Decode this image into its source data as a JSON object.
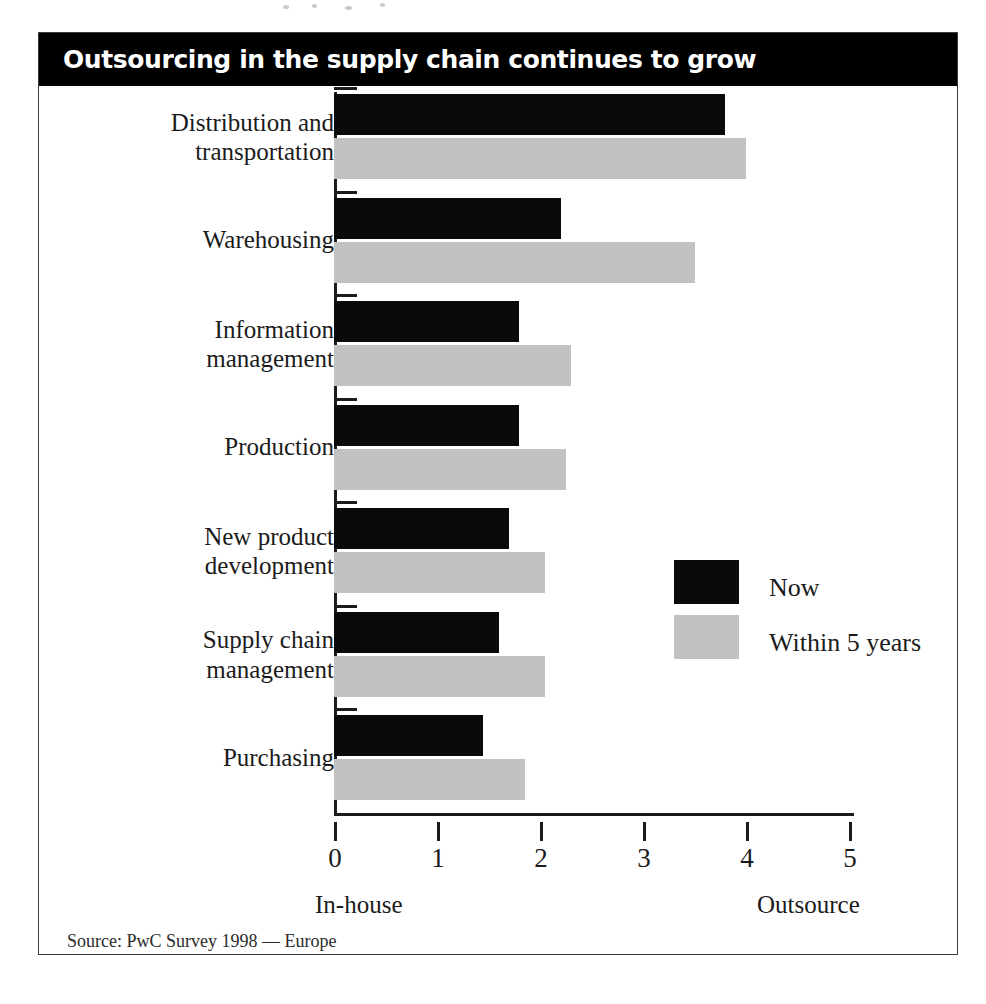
{
  "figure": {
    "title": "Outsourcing in the supply chain continues to grow",
    "source_note": "Source: PwC Survey 1998 — Europe"
  },
  "colors": {
    "title_bar_background": "#000000",
    "title_text": "#ffffff",
    "series_now": "#0a0a0a",
    "series_within_5_years": "#c2c2c2",
    "axis": "#1b1b1b",
    "frame": "#3a3a3a",
    "page_background": "#ffffff"
  },
  "chart_data": {
    "type": "bar",
    "orientation": "horizontal",
    "title": "Outsourcing in the supply chain continues to grow",
    "xlabel": "",
    "ylabel": "",
    "xlim": [
      0,
      5
    ],
    "xticks": [
      "0",
      "1",
      "2",
      "3",
      "4",
      "5"
    ],
    "grid": false,
    "legend_position": "inside-right",
    "axis_end_labels": {
      "left": "In-house",
      "right": "Outsource"
    },
    "categories": [
      "Distribution and transportation",
      "Warehousing",
      "Information management",
      "Production",
      "New product development",
      "Supply chain management",
      "Purchasing"
    ],
    "category_label_lines": [
      [
        "Distribution and",
        "transportation"
      ],
      [
        "Warehousing"
      ],
      [
        "Information",
        "management"
      ],
      [
        "Production"
      ],
      [
        "New product",
        "development"
      ],
      [
        "Supply chain",
        "management"
      ],
      [
        "Purchasing"
      ]
    ],
    "series": [
      {
        "name": "Now",
        "color": "#0a0a0a",
        "values": [
          3.8,
          2.2,
          1.8,
          1.8,
          1.7,
          1.6,
          1.45
        ]
      },
      {
        "name": "Within 5 years",
        "color": "#c2c2c2",
        "values": [
          4.0,
          3.5,
          2.3,
          2.25,
          2.05,
          2.05,
          1.85
        ]
      }
    ]
  },
  "legend": {
    "entries": [
      {
        "label": "Now"
      },
      {
        "label": "Within 5 years"
      }
    ]
  }
}
